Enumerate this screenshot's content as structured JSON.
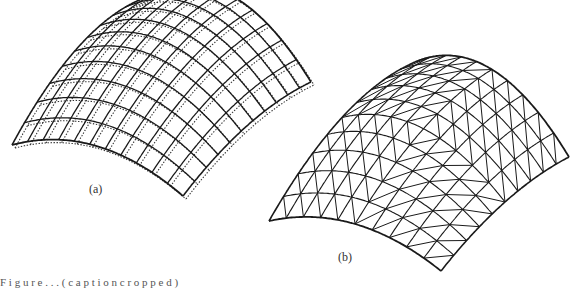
{
  "figure": {
    "panels": [
      {
        "id": "a",
        "label": "(a)",
        "description": "Quadrilateral grid shell, original (solid) and deformed (dotted) mesh",
        "corners": {
          "back": [
            150,
            -4
          ],
          "right": [
            311,
            82
          ],
          "bottom": [
            183,
            196
          ],
          "left": [
            12,
            145
          ]
        },
        "bulge": 44,
        "grid_u": 11,
        "grid_v": 11,
        "style": "quad",
        "stroke": "#1a1a1a",
        "dotted_offset": [
          3,
          3
        ],
        "dotted_stroke": "#333333"
      },
      {
        "id": "b",
        "label": "(b)",
        "description": "Triangulated grid shell",
        "corners": {
          "back": [
            415,
            62
          ],
          "right": [
            569,
            157
          ],
          "bottom": [
            441,
            271
          ],
          "left": [
            269,
            221
          ]
        },
        "bulge": 40,
        "grid_u": 10,
        "grid_v": 10,
        "style": "triangle",
        "stroke": "#1a1a1a"
      }
    ],
    "caption": "F i g u r e   . . .   ( c a p t i o n   c r o p p e d )"
  }
}
